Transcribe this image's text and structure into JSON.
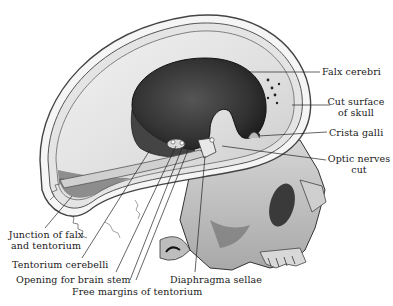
{
  "figure": {
    "colors": {
      "background": "#ffffff",
      "ink": "#1a1a1a",
      "bone": "#e6e6e6",
      "bone_shadow": "#9a9a9a",
      "cavity_dark": "#2e2e2e",
      "cavity_mid": "#555555"
    }
  },
  "labels": {
    "falx_cerebri": "Falx cerebri",
    "cut_surface_line1": "Cut surface",
    "cut_surface_line2": "of skull",
    "crista_galli": "Crista galli",
    "optic_nerves_line1": "Optic nerves",
    "optic_nerves_line2": "cut",
    "junction_line1": "Junction of falx",
    "junction_line2": "and tentorium",
    "tentorium_cerebelli": "Tentorium cerebelli",
    "opening_brain_stem": "Opening for brain stem",
    "free_margins": "Free margins of tentorium",
    "diaphragma_sellae": "Diaphragma sellae"
  }
}
